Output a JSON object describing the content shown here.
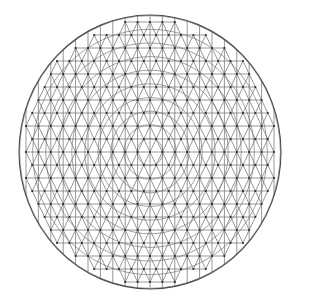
{
  "diagram": {
    "type": "triangulated-circular-mesh",
    "geometry": {
      "width": 293,
      "height": 300,
      "center_x": 150,
      "center_y": 152,
      "radius_x": 131,
      "radius_y": 137,
      "vertical_spacing": 12.4,
      "row_spacing": 13.0,
      "ring_count": 10
    },
    "colors": {
      "background": "#ffffff",
      "edge": "#6a6a6a",
      "arc": "#7a7a7a",
      "boundary": "#4a4a4a",
      "node": "#2a2a2a"
    }
  }
}
